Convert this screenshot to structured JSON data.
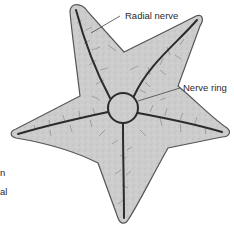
{
  "diagram": {
    "labels": {
      "radial_nerve": "Radial nerve",
      "nerve_ring": "Nerve ring"
    },
    "cut_off_text": [
      "n",
      "al"
    ],
    "colors": {
      "body_fill": "#c9c9c9",
      "outline": "#555555",
      "nerve": "#2b2b2b",
      "branches": "#6a6a6a",
      "text": "#2a2a2a"
    }
  }
}
